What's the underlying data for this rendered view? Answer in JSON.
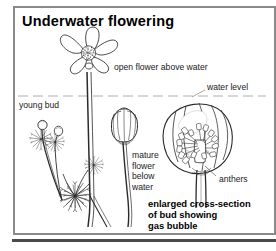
{
  "figure": {
    "title": "Underwater flowering",
    "domain": "botanical-illustration",
    "background_color": "#ffffff",
    "frame_color": "#8a8a8a",
    "ink_color": "#1a1a1a",
    "bottom_bar_color": "#4a4a4a"
  },
  "labels": {
    "open_flower": "open flower above water",
    "water_level": "water level",
    "young_bud": "young bud",
    "mature_flower": "mature\nflower\nbelow\nwater",
    "anthers": "anthers"
  },
  "caption": {
    "text": "enlarged cross-section\nof bud showing\ngas bubble"
  },
  "illustrations": [
    {
      "name": "open-flower-above-water",
      "petals": 5,
      "has_stippled_center": true
    },
    {
      "name": "young-bud-plant",
      "has_feathery_leaves": true
    },
    {
      "name": "mature-flower-below-water",
      "state": "closed-cup"
    },
    {
      "name": "bud-cross-section",
      "shows": "anthers and gas bubble"
    }
  ]
}
